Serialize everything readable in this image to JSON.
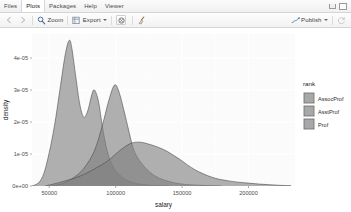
{
  "window": {
    "tabs": [
      {
        "label": "Files",
        "active": false
      },
      {
        "label": "Plots",
        "active": true
      },
      {
        "label": "Packages",
        "active": false
      },
      {
        "label": "Help",
        "active": false
      },
      {
        "label": "Viewer",
        "active": false
      }
    ],
    "controls": [
      {
        "name": "minimize-button",
        "label": ""
      },
      {
        "name": "maximize-button",
        "label": ""
      }
    ]
  },
  "toolbar": {
    "back_label": "",
    "forward_label": "",
    "zoom_label": "Zoom",
    "export_label": "Export",
    "remove_label": "",
    "clear_label": "",
    "publish_label": "Publish"
  },
  "chart_data": {
    "type": "area",
    "title": "",
    "xlabel": "salary",
    "ylabel": "density",
    "xlim": [
      37000,
      235000
    ],
    "ylim": [
      0,
      4.75e-05
    ],
    "xticks": [
      50000,
      100000,
      150000,
      200000
    ],
    "xticklabels": [
      "50000",
      "100000",
      "150000",
      "200000"
    ],
    "yticks": [
      0,
      1e-05,
      2e-05,
      3e-05,
      4e-05
    ],
    "yticklabels": [
      "0e+00",
      "1e-05",
      "2e-05",
      "3e-05",
      "4e-05"
    ],
    "grid": true,
    "legend": {
      "title": "rank",
      "position": "right",
      "entries": [
        {
          "label": "AssocProf",
          "color": "#7f7f7f"
        },
        {
          "label": "AsstProf",
          "color": "#7f7f7f"
        },
        {
          "label": "Prof",
          "color": "#7f7f7f"
        }
      ]
    },
    "series": [
      {
        "name": "AsstProf",
        "color": "#7f7f7f",
        "points": [
          [
            37000,
            0.0
          ],
          [
            42000,
            1e-06
          ],
          [
            46000,
            4e-06
          ],
          [
            50000,
            1.05e-05
          ],
          [
            54000,
            1.9e-05
          ],
          [
            58000,
            3e-05
          ],
          [
            62000,
            4.1e-05
          ],
          [
            65000,
            4.55e-05
          ],
          [
            67000,
            4.3e-05
          ],
          [
            70000,
            3.4e-05
          ],
          [
            73000,
            2.55e-05
          ],
          [
            76000,
            2.15e-05
          ],
          [
            79000,
            2.35e-05
          ],
          [
            82000,
            2.85e-05
          ],
          [
            84000,
            3e-05
          ],
          [
            87000,
            2.65e-05
          ],
          [
            90000,
            1.85e-05
          ],
          [
            93000,
            1.2e-05
          ],
          [
            96000,
            7.8e-06
          ],
          [
            100000,
            4.8e-06
          ],
          [
            105000,
            2.8e-06
          ],
          [
            110000,
            1.5e-06
          ],
          [
            118000,
            6e-07
          ],
          [
            128000,
            2e-07
          ],
          [
            140000,
            0.0
          ]
        ]
      },
      {
        "name": "AssocProf",
        "color": "#7f7f7f",
        "points": [
          [
            52000,
            0.0
          ],
          [
            60000,
            8e-07
          ],
          [
            68000,
            2.5e-06
          ],
          [
            76000,
            5.5e-06
          ],
          [
            84000,
            1.1e-05
          ],
          [
            90000,
            1.9e-05
          ],
          [
            95000,
            2.7e-05
          ],
          [
            99000,
            3.15e-05
          ],
          [
            102000,
            3e-05
          ],
          [
            106000,
            2.4e-05
          ],
          [
            110000,
            1.7e-05
          ],
          [
            113000,
            1.2e-05
          ],
          [
            116000,
            9.2e-06
          ],
          [
            120000,
            6.8e-06
          ],
          [
            126000,
            4.2e-06
          ],
          [
            133000,
            2.4e-06
          ],
          [
            142000,
            1.2e-06
          ],
          [
            152000,
            5e-07
          ],
          [
            165000,
            2e-07
          ],
          [
            180000,
            0.0
          ]
        ]
      },
      {
        "name": "Prof",
        "color": "#7f7f7f",
        "points": [
          [
            47000,
            0.0
          ],
          [
            55000,
            8e-07
          ],
          [
            62000,
            1.6e-06
          ],
          [
            70000,
            2.6e-06
          ],
          [
            78000,
            4e-06
          ],
          [
            86000,
            5.8e-06
          ],
          [
            94000,
            7.8e-06
          ],
          [
            100000,
            1e-05
          ],
          [
            106000,
            1.2e-05
          ],
          [
            112000,
            1.34e-05
          ],
          [
            118000,
            1.37e-05
          ],
          [
            124000,
            1.32e-05
          ],
          [
            130000,
            1.24e-05
          ],
          [
            136000,
            1.14e-05
          ],
          [
            142000,
            1e-05
          ],
          [
            148000,
            8.4e-06
          ],
          [
            154000,
            6.6e-06
          ],
          [
            160000,
            5e-06
          ],
          [
            166000,
            3.8e-06
          ],
          [
            172000,
            2.8e-06
          ],
          [
            178000,
            2.1e-06
          ],
          [
            185000,
            1.6e-06
          ],
          [
            192000,
            1.2e-06
          ],
          [
            200000,
            9e-07
          ],
          [
            208000,
            6e-07
          ],
          [
            216000,
            4e-07
          ],
          [
            224000,
            2e-07
          ],
          [
            232000,
            1e-07
          ]
        ]
      }
    ]
  }
}
